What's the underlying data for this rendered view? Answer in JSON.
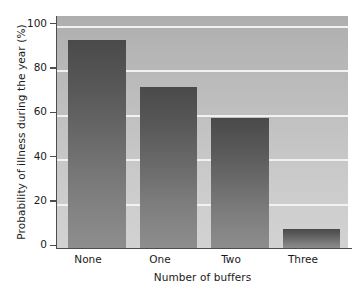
{
  "chart_data": {
    "type": "bar",
    "title": "",
    "categories": [
      "None",
      "One",
      "Two",
      "Three"
    ],
    "values": [
      94,
      73,
      59,
      9
    ],
    "xlabel": "Number of buffers",
    "ylabel": "Probability of illness during the year (%)",
    "ylim": [
      0,
      105
    ],
    "yticks": [
      0,
      20,
      40,
      60,
      80,
      100
    ],
    "ytick_labels": [
      "0",
      "20",
      "40",
      "60",
      "80",
      "100"
    ],
    "grid": "horizontal-only",
    "gridline_color": "#f2f2f2",
    "legend": "none",
    "plot_background": "#bdbdbd",
    "bar_color": "#6a6a6a",
    "axis_color": "#4d4d4d"
  },
  "axes": {
    "y_title": "Probability of illness during the year (%)",
    "x_title": "Number of buffers"
  }
}
